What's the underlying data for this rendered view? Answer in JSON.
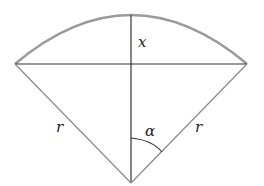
{
  "diagram": {
    "labels": {
      "height": "x",
      "radius_left": "r",
      "radius_right": "r",
      "angle": "α"
    },
    "colors": {
      "arc": "#9a9a9a",
      "chord": "#333333",
      "radius": "#8a8a8a",
      "axis": "#333333",
      "background": "#ffffff"
    }
  }
}
